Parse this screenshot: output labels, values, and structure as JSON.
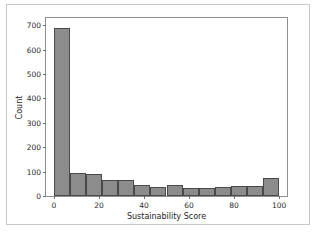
{
  "chart_data": {
    "type": "bar",
    "subtype": "histogram",
    "title": "",
    "xlabel": "Sustainability Score",
    "ylabel": "Count",
    "xlim": [
      -3.5,
      103.5
    ],
    "ylim": [
      0,
      730
    ],
    "grid": false,
    "legend": null,
    "bin_width": 7.14,
    "bin_edges": [
      0,
      7.14,
      14.29,
      21.43,
      28.57,
      35.71,
      42.86,
      50,
      57.14,
      64.29,
      71.43,
      78.57,
      85.71,
      92.86,
      100
    ],
    "categories": [
      "0-7",
      "7-14",
      "14-21",
      "21-29",
      "29-36",
      "36-43",
      "43-50",
      "50-57",
      "57-64",
      "64-71",
      "71-79",
      "79-86",
      "86-93",
      "93-100"
    ],
    "values": [
      690,
      95,
      91,
      67,
      67,
      45,
      35,
      47,
      31,
      31,
      38,
      42,
      42,
      72
    ],
    "xticks": [
      0,
      20,
      40,
      60,
      80,
      100
    ],
    "xtick_labels": [
      "0",
      "20",
      "40",
      "60",
      "80",
      "100"
    ],
    "yticks": [
      0,
      100,
      200,
      300,
      400,
      500,
      600,
      700
    ],
    "ytick_labels": [
      "0",
      "100",
      "200",
      "300",
      "400",
      "500",
      "600",
      "700"
    ],
    "bar_color": "#8c8c8c",
    "bar_edge_color": "#4a4a4a",
    "background_color": "#ffffff"
  }
}
